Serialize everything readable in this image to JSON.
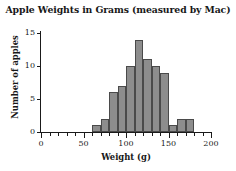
{
  "chart_data": {
    "type": "bar",
    "title": "Apple Weights in Grams (measured by Mac)",
    "xlabel": "Weight (g)",
    "ylabel": "Number of apples",
    "xlim": [
      0,
      200
    ],
    "ylim": [
      0,
      15
    ],
    "grid": false,
    "legend": "none",
    "bin_width": 10,
    "bin_edges": [
      60,
      70,
      80,
      90,
      100,
      110,
      120,
      130,
      140,
      150,
      160,
      170,
      180
    ],
    "categories": [
      "60-70",
      "70-80",
      "80-90",
      "90-100",
      "100-110",
      "110-120",
      "120-130",
      "130-140",
      "140-150",
      "150-160",
      "160-170",
      "170-180"
    ],
    "values": [
      1,
      2,
      6,
      7,
      10,
      14,
      11,
      10,
      9,
      1,
      2,
      2
    ],
    "bars": [
      {
        "start": 60,
        "end": 70,
        "value": 1
      },
      {
        "start": 70,
        "end": 80,
        "value": 2
      },
      {
        "start": 80,
        "end": 90,
        "value": 6
      },
      {
        "start": 90,
        "end": 100,
        "value": 7
      },
      {
        "start": 100,
        "end": 110,
        "value": 10
      },
      {
        "start": 110,
        "end": 120,
        "value": 14
      },
      {
        "start": 120,
        "end": 130,
        "value": 11
      },
      {
        "start": 130,
        "end": 140,
        "value": 10
      },
      {
        "start": 140,
        "end": 150,
        "value": 9
      },
      {
        "start": 150,
        "end": 160,
        "value": 1
      },
      {
        "start": 160,
        "end": 170,
        "value": 2
      },
      {
        "start": 170,
        "end": 180,
        "value": 2
      }
    ],
    "x_ticks_major": [
      0,
      50,
      100,
      150,
      200
    ],
    "x_tick_labels": [
      "0",
      "50",
      "100",
      "150",
      "200"
    ],
    "x_ticks_minor": [
      10,
      20,
      30,
      40,
      60,
      70,
      80,
      90,
      110,
      120,
      130,
      140,
      160,
      170,
      180,
      190
    ],
    "y_ticks": [
      0,
      5,
      10,
      15
    ],
    "y_tick_labels": [
      "0",
      "5",
      "10",
      "15"
    ],
    "colors": {
      "bar_fill": "#8d8d8d",
      "bar_stroke": "#4a4a4a",
      "axis": "#1a1a1a",
      "text": "#171717",
      "background": "#ffffff"
    }
  }
}
